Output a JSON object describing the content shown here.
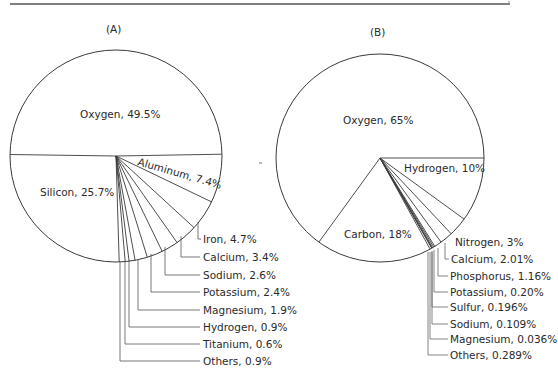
{
  "chart_data": [
    {
      "type": "pie",
      "title": "(A)",
      "center": [
        116,
        156
      ],
      "radius": 106,
      "slices": [
        {
          "label": "Oxygen",
          "value": 49.5,
          "text": "Oxygen, 49.5%"
        },
        {
          "label": "Silicon",
          "value": 25.7,
          "text": "Silicon, 25.7%"
        },
        {
          "label": "Aluminum",
          "value": 7.4,
          "text": "Aluminum, 7.4%"
        },
        {
          "label": "Iron",
          "value": 4.7,
          "text": "Iron, 4.7%"
        },
        {
          "label": "Calcium",
          "value": 3.4,
          "text": "Calcium, 3.4%"
        },
        {
          "label": "Sodium",
          "value": 2.6,
          "text": "Sodium, 2.6%"
        },
        {
          "label": "Potassium",
          "value": 2.4,
          "text": "Potassium, 2.4%"
        },
        {
          "label": "Magnesium",
          "value": 1.9,
          "text": "Magnesium, 1.9%"
        },
        {
          "label": "Hydrogen",
          "value": 0.9,
          "text": "Hydrogen, 0.9%"
        },
        {
          "label": "Titanium",
          "value": 0.6,
          "text": "Titanium, 0.6%"
        },
        {
          "label": "Others",
          "value": 0.9,
          "text": "Others, 0.9%"
        }
      ]
    },
    {
      "type": "pie",
      "title": "(B)",
      "center": [
        380,
        158
      ],
      "radius": 104,
      "slices": [
        {
          "label": "Oxygen",
          "value": 65,
          "text": "Oxygen, 65%"
        },
        {
          "label": "Carbon",
          "value": 18,
          "text": "Carbon, 18%"
        },
        {
          "label": "Hydrogen",
          "value": 10,
          "text": "Hydrogen, 10%"
        },
        {
          "label": "Nitrogen",
          "value": 3,
          "text": "Nitrogen, 3%"
        },
        {
          "label": "Calcium",
          "value": 2.01,
          "text": "Calcium, 2.01%"
        },
        {
          "label": "Phosphorus",
          "value": 1.16,
          "text": "Phosphorus, 1.16%"
        },
        {
          "label": "Potassium",
          "value": 0.2,
          "text": "Potassium, 0.20%"
        },
        {
          "label": "Sulfur",
          "value": 0.196,
          "text": "Sulfur, 0.196%"
        },
        {
          "label": "Sodium",
          "value": 0.109,
          "text": "Sodium, 0.109%"
        },
        {
          "label": "Magnesium",
          "value": 0.036,
          "text": "Magnesium, 0.036%"
        },
        {
          "label": "Others",
          "value": 0.289,
          "text": "Others, 0.289%"
        }
      ]
    }
  ],
  "panels": {
    "a": {
      "title": "(A)",
      "inside_labels": {
        "oxygen": "Oxygen, 49.5%",
        "silicon": "Silicon, 25.7%",
        "aluminum": "Aluminum, 7.4%"
      },
      "callouts": [
        "Iron, 4.7%",
        "Calcium, 3.4%",
        "Sodium, 2.6%",
        "Potassium, 2.4%",
        "Magnesium, 1.9%",
        "Hydrogen, 0.9%",
        "Titanium, 0.6%",
        "Others, 0.9%"
      ]
    },
    "b": {
      "title": "(B)",
      "inside_labels": {
        "oxygen": "Oxygen, 65%",
        "hydrogen": "Hydrogen, 10%",
        "carbon": "Carbon, 18%"
      },
      "callouts": [
        "Nitrogen, 3%",
        "Calcium, 2.01%",
        "Phosphorus, 1.16%",
        "Potassium, 0.20%",
        "Sulfur, 0.196%",
        "Sodium, 0.109%",
        "Magnesium, 0.036%",
        "Others, 0.289%"
      ]
    }
  },
  "colors": {
    "line": "#3a3a3a",
    "text": "#2a2a2a",
    "background": "#ffffff"
  }
}
